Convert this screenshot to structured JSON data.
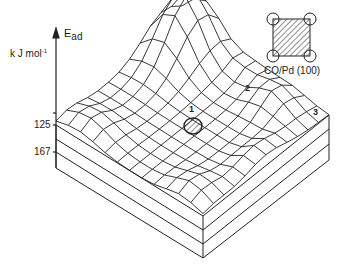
{
  "axis": {
    "label": "E",
    "label_sub": "ad",
    "unit": "k J mol",
    "unit_sup": "-1",
    "ticks": [
      {
        "label": "125"
      },
      {
        "label": "167"
      }
    ]
  },
  "sites": [
    {
      "label": "1"
    },
    {
      "label": "2"
    },
    {
      "label": "3"
    }
  ],
  "inset": {
    "caption": "CO/Pd (100)"
  },
  "colors": {
    "line": "#222222",
    "background": "#ffffff"
  }
}
